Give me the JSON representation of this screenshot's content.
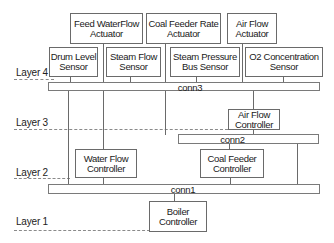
{
  "diagram": {
    "layers": [
      {
        "label": "Layer 4"
      },
      {
        "label": "Layer 3"
      },
      {
        "label": "Layer 2"
      },
      {
        "label": "Layer 1"
      }
    ],
    "actuators": [
      {
        "line1": "Feed WaterFlow",
        "line2": "Actuator"
      },
      {
        "line1": "Coal Feeder Rate",
        "line2": "Actuator"
      },
      {
        "line1": "Air Flow",
        "line2": "Actuator"
      }
    ],
    "sensors": [
      {
        "line1": "Drum Level",
        "line2": "Sensor"
      },
      {
        "line1": "Steam Flow",
        "line2": "Sensor"
      },
      {
        "line1": "Steam Pressure",
        "line2": "Bus Sensor"
      },
      {
        "line1": "O2 Concentration",
        "line2": "Sensor"
      }
    ],
    "buses": {
      "conn3": "conn3",
      "conn2": "conn2",
      "conn1": "conn1"
    },
    "controllers": {
      "air_flow": {
        "line1": "Air Flow",
        "line2": "Controller"
      },
      "water_flow": {
        "line1": "Water Flow",
        "line2": "Controller"
      },
      "coal_feeder": {
        "line1": "Coal Feeder",
        "line2": "Controller"
      },
      "boiler": {
        "line1": "Boiler",
        "line2": "Controller"
      }
    },
    "colors": {
      "line": "#6a6a6a",
      "dashed": "#8a8a8a",
      "background": "#ffffff"
    }
  }
}
